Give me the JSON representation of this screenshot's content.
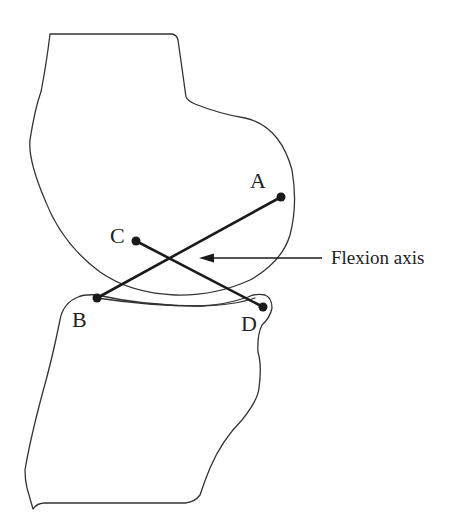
{
  "diagram": {
    "type": "knee-joint-cruciate-ligament-schematic",
    "points": {
      "A": {
        "label": "A",
        "x": 281,
        "y": 197
      },
      "B": {
        "label": "B",
        "x": 97,
        "y": 298
      },
      "C": {
        "label": "C",
        "x": 136,
        "y": 241
      },
      "D": {
        "label": "D",
        "x": 263,
        "y": 307
      }
    },
    "links": [
      {
        "from": "A",
        "to": "B"
      },
      {
        "from": "C",
        "to": "D"
      }
    ],
    "annotation": {
      "label": "Flexion axis"
    },
    "colors": {
      "outline": "#333333",
      "ligament": "#1a1a1a",
      "text": "#222222",
      "background": "#ffffff"
    }
  }
}
